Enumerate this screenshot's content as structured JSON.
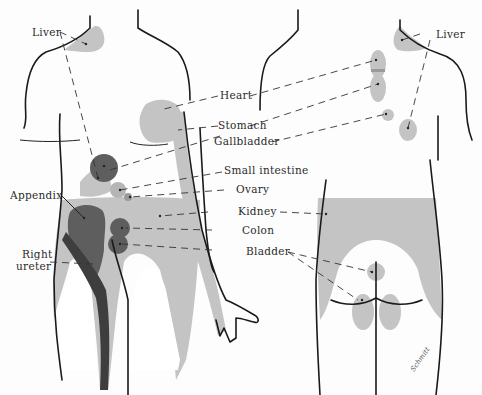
{
  "diagram": {
    "labels": {
      "liver_front": "Liver",
      "liver_back": "Liver",
      "heart": "Heart",
      "stomach": "Stomach",
      "gallbladder": "Gallbladder",
      "small_intestine": "Small intestine",
      "ovary": "Ovary",
      "appendix": "Appendix",
      "kidney": "Kidney",
      "colon": "Colon",
      "right_ureter_line1": "Right",
      "right_ureter_line2": "ureter",
      "bladder": "Bladder"
    },
    "signature": "Schmitt",
    "colors": {
      "light_shade": "#c4c4c4",
      "medium_shade": "#9a9a9a",
      "dark_shade": "#5e5e5e",
      "darkest_shade": "#3e3e3e",
      "outline": "#1a1a1a"
    }
  }
}
